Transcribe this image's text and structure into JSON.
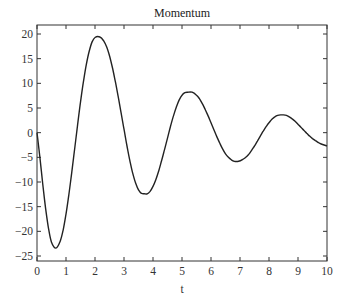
{
  "chart_data": {
    "type": "line",
    "title": "Momentum",
    "xlabel": "t",
    "ylabel": "",
    "xlim": [
      0,
      10
    ],
    "ylim": [
      -26,
      22
    ],
    "grid": false,
    "legend": null,
    "xticks": [
      0,
      1,
      2,
      3,
      4,
      5,
      6,
      7,
      8,
      9,
      10
    ],
    "yticks": [
      20,
      15,
      10,
      5,
      0,
      -5,
      -10,
      -15,
      -20,
      -25
    ],
    "series": [
      {
        "name": "momentum",
        "x": [
          0,
          0.1,
          0.2,
          0.3,
          0.4,
          0.5,
          0.65,
          0.8,
          0.9,
          1.0,
          1.1,
          1.2,
          1.3,
          1.4,
          1.5,
          1.6,
          1.7,
          1.8,
          1.9,
          2.0,
          2.17,
          2.3,
          2.4,
          2.5,
          2.6,
          2.7,
          2.8,
          2.9,
          3.0,
          3.1,
          3.2,
          3.3,
          3.4,
          3.5,
          3.6,
          3.7,
          3.8,
          3.9,
          4.0,
          4.1,
          4.2,
          4.3,
          4.4,
          4.5,
          4.6,
          4.7,
          4.8,
          4.9,
          5.0,
          5.1,
          5.2,
          5.35,
          5.5,
          5.6,
          5.7,
          5.8,
          5.9,
          6.0,
          6.1,
          6.2,
          6.3,
          6.4,
          6.5,
          6.6,
          6.7,
          6.8,
          6.95,
          7.1,
          7.2,
          7.3,
          7.4,
          7.5,
          7.6,
          7.7,
          7.8,
          7.9,
          8.0,
          8.1,
          8.2,
          8.3,
          8.4,
          8.5,
          8.6,
          8.7,
          8.8,
          8.9,
          9.0,
          9.1,
          9.2,
          9.3,
          9.4,
          9.5,
          9.6,
          9.7,
          9.8,
          9.9,
          10.0
        ],
        "values": [
          0,
          -5.0,
          -10.5,
          -15.5,
          -19.5,
          -22.2,
          -23.4,
          -22.0,
          -19.8,
          -16.5,
          -12.5,
          -8.0,
          -3.2,
          1.6,
          6.2,
          10.3,
          13.8,
          16.5,
          18.4,
          19.3,
          19.4,
          18.6,
          17.4,
          15.6,
          13.2,
          10.4,
          7.3,
          4.0,
          0.7,
          -2.6,
          -5.6,
          -8.2,
          -10.2,
          -11.6,
          -12.3,
          -12.4,
          -12.4,
          -11.9,
          -10.9,
          -9.5,
          -7.7,
          -5.6,
          -3.4,
          -1.1,
          1.2,
          3.3,
          5.1,
          6.6,
          7.6,
          8.1,
          8.2,
          8.2,
          7.6,
          6.9,
          5.9,
          4.7,
          3.4,
          2.0,
          0.6,
          -0.8,
          -2.1,
          -3.3,
          -4.3,
          -5.0,
          -5.5,
          -5.8,
          -5.8,
          -5.4,
          -5.0,
          -4.4,
          -3.6,
          -2.7,
          -1.7,
          -0.7,
          0.3,
          1.2,
          2.0,
          2.7,
          3.2,
          3.5,
          3.6,
          3.6,
          3.5,
          3.2,
          2.8,
          2.3,
          1.7,
          1.1,
          0.5,
          -0.1,
          -0.7,
          -1.2,
          -1.6,
          -2.0,
          -2.3,
          -2.5,
          -2.7
        ]
      }
    ]
  }
}
